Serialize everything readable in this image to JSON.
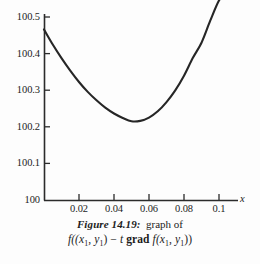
{
  "figure": {
    "caption_label": "Figure 14.19:",
    "caption_text": "graph of",
    "caption_formula": "f((x1, y1) − t grad f(x1, y1))",
    "formula_parts": {
      "f1": "f((",
      "x1": "x",
      "sub1": "1",
      "comma": ", ",
      "y1": "y",
      "sub2": "1",
      "close1": ")",
      "minus": " − ",
      "t": "t",
      "grad": " grad ",
      "f2": "f(",
      "x2": "x",
      "sub3": "1",
      "comma2": ", ",
      "y2": "y",
      "sub4": "1",
      "close2": "))"
    }
  },
  "axes": {
    "x_title": "x",
    "y_title": "",
    "x_ticks": [
      "0.02",
      "0.04",
      "0.06",
      "0.08",
      "0.1"
    ],
    "y_ticks": [
      "100.5",
      "100.4",
      "100.3",
      "100.2",
      "100.1",
      "100"
    ],
    "axis_color": "#2b2b2b",
    "curve_color": "#262626"
  },
  "chart_data": {
    "type": "line",
    "xlabel": "x",
    "ylabel": "",
    "xlim": [
      0.0,
      0.105
    ],
    "ylim": [
      100.0,
      100.56
    ],
    "grid": false,
    "legend": null,
    "x_ticks": [
      0.02,
      0.04,
      0.06,
      0.08,
      0.1
    ],
    "y_ticks": [
      100.0,
      100.1,
      100.2,
      100.3,
      100.4,
      100.5
    ],
    "series": [
      {
        "name": "f((x1,y1) - t grad f(x1,y1))",
        "x": [
          0.0,
          0.005,
          0.01,
          0.015,
          0.02,
          0.025,
          0.03,
          0.035,
          0.04,
          0.045,
          0.05,
          0.055,
          0.06,
          0.065,
          0.07,
          0.075,
          0.08,
          0.085,
          0.09,
          0.095,
          0.1,
          0.1035
        ],
        "y": [
          100.466,
          100.425,
          100.388,
          100.354,
          100.323,
          100.296,
          100.273,
          100.253,
          100.237,
          100.225,
          100.216,
          100.217,
          100.226,
          100.243,
          100.268,
          100.3,
          100.34,
          100.388,
          100.43,
          100.49,
          100.545,
          100.56
        ]
      }
    ],
    "annotations": [
      {
        "text": "minimum near x ≈ 0.05, y ≈ 100.216"
      }
    ]
  }
}
